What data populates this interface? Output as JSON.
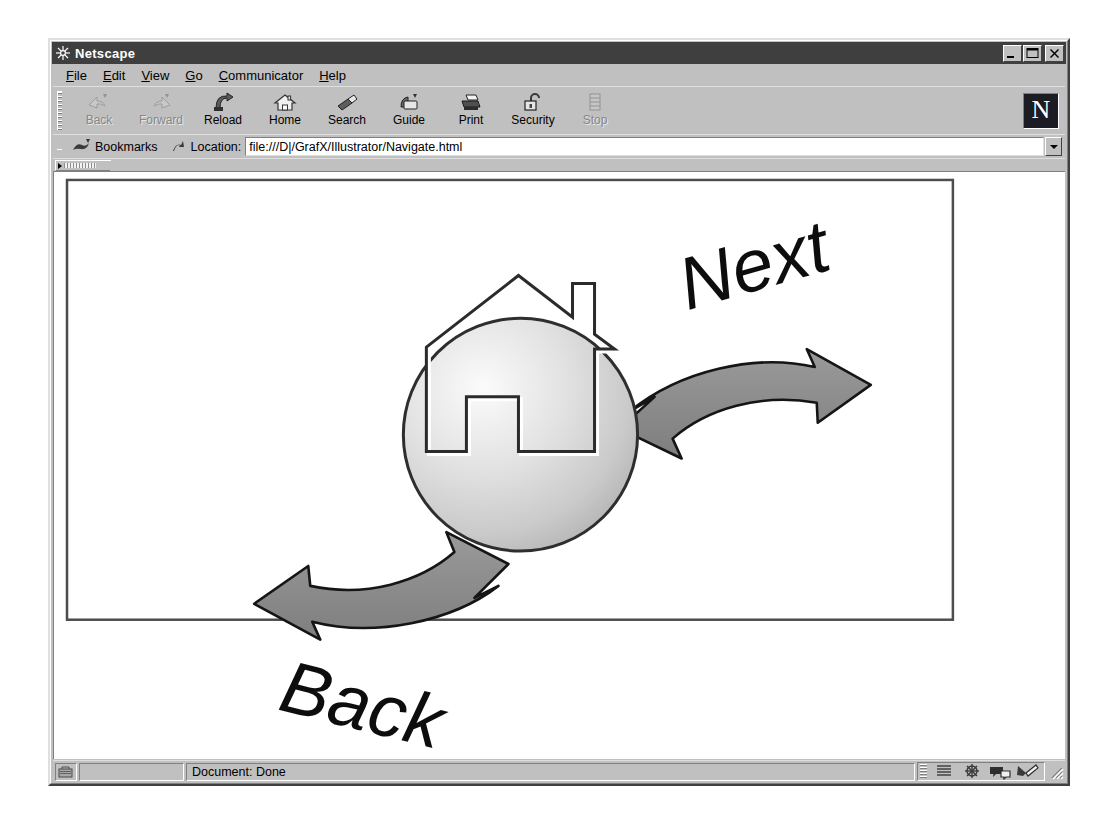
{
  "window": {
    "title": "Netscape",
    "title_icon": "netscape-ship-wheel-icon",
    "controls": {
      "minimize": "minimize-button",
      "maximize": "maximize-button",
      "close": "close-button"
    }
  },
  "menubar": {
    "items": [
      {
        "label": "File",
        "accel": "F"
      },
      {
        "label": "Edit",
        "accel": "E"
      },
      {
        "label": "View",
        "accel": "V"
      },
      {
        "label": "Go",
        "accel": "G"
      },
      {
        "label": "Communicator",
        "accel": "C"
      },
      {
        "label": "Help",
        "accel": "H"
      }
    ]
  },
  "toolbar": {
    "buttons": [
      {
        "label": "Back",
        "icon": "back-arrow-icon",
        "enabled": false
      },
      {
        "label": "Forward",
        "icon": "forward-arrow-icon",
        "enabled": false
      },
      {
        "label": "Reload",
        "icon": "reload-icon",
        "enabled": true
      },
      {
        "label": "Home",
        "icon": "home-house-icon",
        "enabled": true
      },
      {
        "label": "Search",
        "icon": "search-flashlight-icon",
        "enabled": true
      },
      {
        "label": "Guide",
        "icon": "guide-book-icon",
        "enabled": true
      },
      {
        "label": "Print",
        "icon": "printer-icon",
        "enabled": true
      },
      {
        "label": "Security",
        "icon": "padlock-open-icon",
        "enabled": true
      },
      {
        "label": "Stop",
        "icon": "stop-icon",
        "enabled": false
      }
    ],
    "logo": {
      "letter": "N",
      "name": "netscape-n-logo"
    }
  },
  "locationbar": {
    "bookmarks_label": "Bookmarks",
    "location_label": "Location:",
    "url": "file:///D|/GrafX/Illustrator/Navigate.html",
    "url_placeholder": "Location:"
  },
  "statusbar": {
    "status_text": "Document: Done",
    "lock_icon": "security-lock-icon",
    "components": [
      {
        "name": "navigator-icon"
      },
      {
        "name": "mailbox-icon"
      },
      {
        "name": "discussions-icon"
      },
      {
        "name": "composer-icon"
      }
    ]
  },
  "page": {
    "title": "Navigate",
    "graphic_name": "navigation-home-graphic",
    "next_label": "Next",
    "back_label": "Back",
    "home_icon_name": "embossed-house-in-circle",
    "next_arrow_name": "next-banner-arrow",
    "back_arrow_name": "back-banner-arrow",
    "colors": {
      "arrow_fill": "#8c8c8c",
      "arrow_stroke": "#1a1a1a",
      "circle_light": "#f2f2f2",
      "circle_dark": "#b8b8b8",
      "circle_stroke": "#333333",
      "text": "#000000",
      "frame_border": "#4d4d4d"
    }
  }
}
